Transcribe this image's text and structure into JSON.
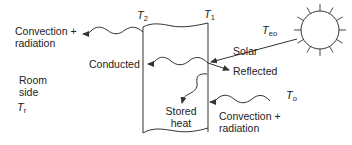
{
  "diagram": {
    "type": "heat-flow through wall",
    "colors": {
      "stroke": "#333333",
      "text": "#222222",
      "background": "#ffffff"
    },
    "wall": {
      "left_surface_temp": {
        "symbol": "T",
        "subscript": "2"
      },
      "right_surface_temp": {
        "symbol": "T",
        "subscript": "1"
      }
    },
    "sun": {
      "temp": {
        "symbol": "T",
        "subscript": "eo"
      },
      "icon": "sun-icon"
    },
    "labels": {
      "convection_left_line1": "Convection +",
      "convection_left_line2": "radiation",
      "conducted": "Conducted",
      "solar": "Solar",
      "reflected": "Reflected",
      "room_side_line1": "Room",
      "room_side_line2": "side",
      "stored_heat_line1": "Stored",
      "stored_heat_line2": "heat",
      "convection_right_line1": "Convection +",
      "convection_right_line2": "radiation"
    },
    "room_temp": {
      "symbol": "T",
      "subscript": "r"
    },
    "outside_temp": {
      "symbol": "T",
      "subscript": "o"
    }
  }
}
